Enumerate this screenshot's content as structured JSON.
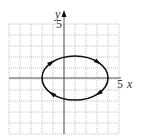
{
  "figure": {
    "type": "parametric-curve-plot",
    "x_axis_label": "x",
    "y_axis_label": "y",
    "x_tick_label": "5",
    "y_tick_label": "5",
    "grid": {
      "x_min": -5,
      "x_max": 5,
      "y_min": -5,
      "y_max": 5,
      "step": 1,
      "style": "dotted"
    },
    "curve": {
      "shape": "ellipse",
      "center": [
        1,
        0
      ],
      "semi_axis_x": 3,
      "semi_axis_y": 2,
      "orientation": "clockwise",
      "arrow_count": 4
    },
    "colors": {
      "background": "#ffffff",
      "grid": "#9a9a9a",
      "axes": "#555555",
      "curve": "#111111"
    }
  }
}
